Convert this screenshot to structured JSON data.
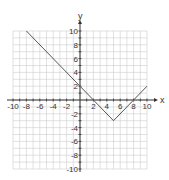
{
  "chart_data": {
    "type": "line",
    "title": "",
    "xlabel": "x",
    "ylabel": "y",
    "xlim": [
      -10,
      10
    ],
    "ylim": [
      -10,
      10
    ],
    "grid": true,
    "x_tick_labels": [
      "-10",
      "-8",
      "-6",
      "-4",
      "-2",
      "2",
      "4",
      "6",
      "8",
      "10"
    ],
    "y_tick_labels": [
      "10",
      "8",
      "6",
      "4",
      "2",
      "-2",
      "-4",
      "-6",
      "-8",
      "-10"
    ],
    "series": [
      {
        "name": "y = |x - 5| - 3",
        "x": [
          -8,
          5,
          10
        ],
        "y": [
          10,
          -3,
          2
        ]
      }
    ],
    "notable_points": {
      "vertex": [
        5,
        -3
      ],
      "y_intercept": [
        0,
        2
      ],
      "x_intercepts": [
        [
          2,
          0
        ],
        [
          8,
          0
        ]
      ]
    }
  },
  "colors": {
    "line": "#555555",
    "grid": "#cccccc",
    "axis": "#333333"
  }
}
